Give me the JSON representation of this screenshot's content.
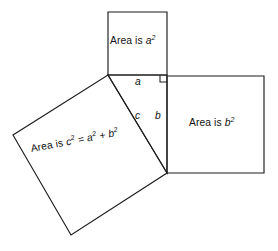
{
  "figure": {
    "kind": "geometry-diagram",
    "concept": "pythagorean-theorem",
    "width": 278,
    "height": 251,
    "background_color": "#ffffff",
    "stroke_color": "#1d1d1d",
    "text_color": "#111111"
  },
  "squares": {
    "on_leg_a": {
      "name": "square-on-leg-a",
      "label_prefix": "Area is ",
      "label_base": "a",
      "label_exponent": "2",
      "points": "108,12 167,12 167,75 108,75"
    },
    "on_leg_b": {
      "name": "square-on-leg-b",
      "label_prefix": "Area is ",
      "label_base": "b",
      "label_exponent": "2",
      "points": "167,76 264,76 264,173 167,173"
    },
    "on_hypotenuse_c": {
      "name": "square-on-hypotenuse-c",
      "label_prefix": "Area is ",
      "label_base": "c",
      "label_exponent": "2",
      "label_equals": " = ",
      "label_term_a": "a",
      "label_term_a_exponent": "2",
      "label_plus": " + ",
      "label_term_b": "b",
      "label_term_b_exponent": "2",
      "points": "108,75 167,173 71,235 13,135"
    }
  },
  "triangle": {
    "name": "right-triangle",
    "points": "108,75 167,75 167,173",
    "vertices": {
      "left": [
        108,
        75
      ],
      "right_angle": [
        167,
        75
      ],
      "bottom": [
        167,
        173
      ]
    }
  },
  "right_angle_marker": {
    "name": "right-angle-marker",
    "path": "M 160 75 L 160 82 L 167 82"
  },
  "side_labels": {
    "a": "a",
    "b": "b",
    "c": "c"
  }
}
